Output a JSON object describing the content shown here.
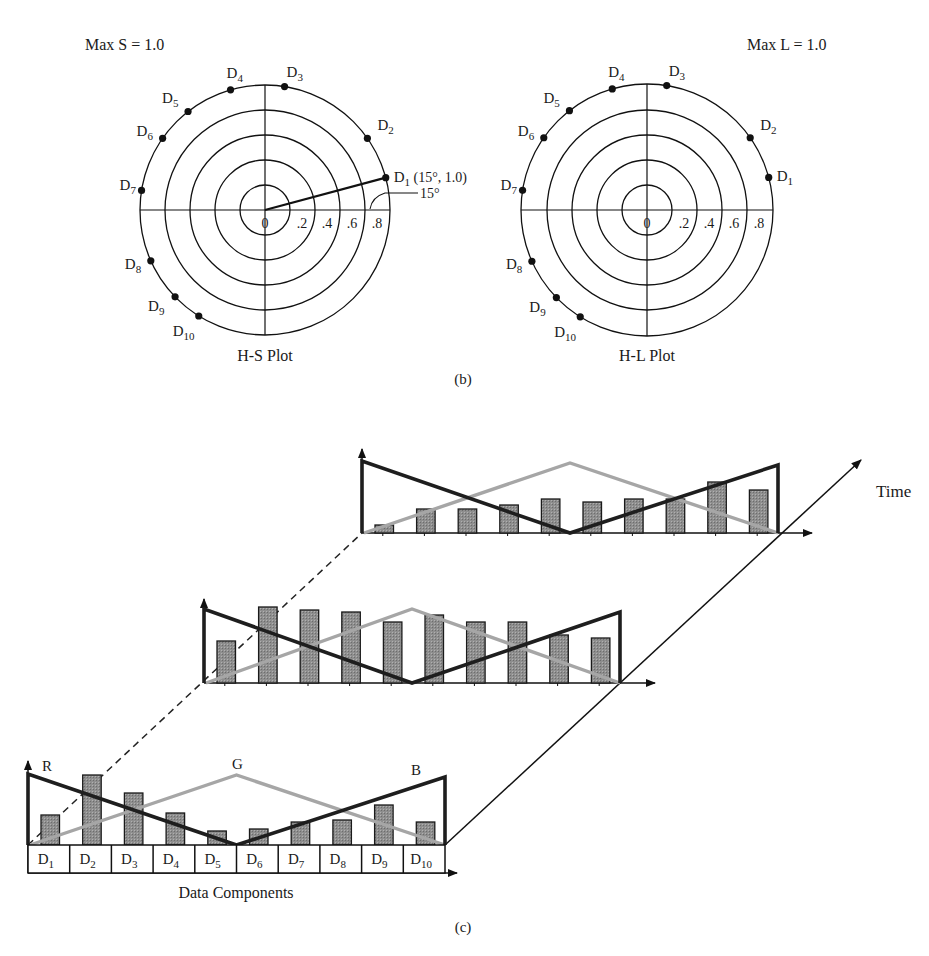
{
  "panel_b": {
    "caption": "(b)",
    "plots": [
      {
        "id": "hs",
        "title": "H-S Plot",
        "max_label": "Max S = 1.0",
        "center": [
          265,
          210
        ],
        "ring_radii": [
          25,
          50,
          75,
          100,
          125
        ],
        "tick_labels": [
          "0",
          ".2",
          ".4",
          ".6",
          ".8"
        ],
        "annotation": {
          "point_label": "(15°, 1.0)",
          "angle_label": "15°"
        },
        "points": [
          {
            "label": "D",
            "sub": "1",
            "angle": 15,
            "r": 1.0
          },
          {
            "label": "D",
            "sub": "2",
            "angle": 35,
            "r": 1.0
          },
          {
            "label": "D",
            "sub": "3",
            "angle": 81,
            "r": 1.0
          },
          {
            "label": "D",
            "sub": "4",
            "angle": 106,
            "r": 1.0
          },
          {
            "label": "D",
            "sub": "5",
            "angle": 128,
            "r": 1.0
          },
          {
            "label": "D",
            "sub": "6",
            "angle": 145,
            "r": 1.0
          },
          {
            "label": "D",
            "sub": "7",
            "angle": 171,
            "r": 1.0
          },
          {
            "label": "D",
            "sub": "8",
            "angle": 204,
            "r": 1.0
          },
          {
            "label": "D",
            "sub": "9",
            "angle": 224,
            "r": 1.0
          },
          {
            "label": "D",
            "sub": "10",
            "angle": 238,
            "r": 1.0
          }
        ]
      },
      {
        "id": "hl",
        "title": "H-L Plot",
        "max_label": "Max L = 1.0",
        "center": [
          647,
          210
        ],
        "ring_radii": [
          25,
          50,
          75,
          100,
          126
        ],
        "tick_labels": [
          "0",
          ".2",
          ".4",
          ".6",
          ".8"
        ],
        "points": [
          {
            "label": "D",
            "sub": "1",
            "angle": 15,
            "r": 1.0
          },
          {
            "label": "D",
            "sub": "2",
            "angle": 35,
            "r": 1.0
          },
          {
            "label": "D",
            "sub": "3",
            "angle": 81,
            "r": 1.0
          },
          {
            "label": "D",
            "sub": "4",
            "angle": 106,
            "r": 1.0
          },
          {
            "label": "D",
            "sub": "5",
            "angle": 128,
            "r": 1.0
          },
          {
            "label": "D",
            "sub": "6",
            "angle": 145,
            "r": 1.0
          },
          {
            "label": "D",
            "sub": "7",
            "angle": 171,
            "r": 1.0
          },
          {
            "label": "D",
            "sub": "8",
            "angle": 204,
            "r": 1.0
          },
          {
            "label": "D",
            "sub": "9",
            "angle": 224,
            "r": 1.0
          },
          {
            "label": "D",
            "sub": "10",
            "angle": 238,
            "r": 1.0
          }
        ]
      }
    ]
  },
  "panel_c": {
    "caption": "(c)",
    "time_label": "Time",
    "x_axis_label": "Data Components",
    "series_labels": {
      "r": "R",
      "g": "G",
      "b": "B"
    },
    "colors": {
      "bar_fill": "#8a8a8a",
      "bar_stroke": "#1a1a1a",
      "rb_line": "#1e1e1e",
      "g_line": "#a6a6a6",
      "axis": "#111111"
    },
    "components": [
      "D1",
      "D2",
      "D3",
      "D4",
      "D5",
      "D6",
      "D7",
      "D8",
      "D9",
      "D10"
    ],
    "slices": [
      {
        "name": "t0 (front)",
        "origin": [
          28,
          845
        ],
        "x_end": 457,
        "step": 41.7,
        "y_top": 765,
        "bar_heights": [
          30,
          70,
          52,
          32,
          14,
          16,
          23,
          25,
          40,
          23
        ],
        "r_start": 71,
        "g_peak": 70,
        "b_end": 68,
        "has_table": true
      },
      {
        "name": "t1 (middle)",
        "origin": [
          204,
          683
        ],
        "x_end": 655,
        "step": 41.6,
        "y_top": 603,
        "bar_heights": [
          42,
          76,
          73,
          71,
          61,
          68,
          61,
          61,
          48,
          45
        ],
        "r_start": 74,
        "g_peak": 74,
        "b_end": 71,
        "has_table": false
      },
      {
        "name": "t2 (back)",
        "origin": [
          362,
          533
        ],
        "x_end": 812,
        "step": 41.6,
        "y_top": 453,
        "bar_heights": [
          8,
          24,
          24,
          28,
          34,
          31,
          34,
          34,
          51,
          43
        ],
        "r_start": 72,
        "g_peak": 70,
        "b_end": 68,
        "has_table": false
      }
    ]
  },
  "chart_data": [
    {
      "type": "scatter",
      "title": "H-S Plot",
      "subtitle": "Max S = 1.0",
      "coordinate": "polar",
      "radial_ticks": [
        0,
        0.2,
        0.4,
        0.6,
        0.8
      ],
      "points": [
        {
          "name": "D1",
          "angle_deg": 15,
          "r": 1.0
        },
        {
          "name": "D2",
          "angle_deg": 35,
          "r": 1.0
        },
        {
          "name": "D3",
          "angle_deg": 81,
          "r": 1.0
        },
        {
          "name": "D4",
          "angle_deg": 106,
          "r": 1.0
        },
        {
          "name": "D5",
          "angle_deg": 128,
          "r": 1.0
        },
        {
          "name": "D6",
          "angle_deg": 145,
          "r": 1.0
        },
        {
          "name": "D7",
          "angle_deg": 171,
          "r": 1.0
        },
        {
          "name": "D8",
          "angle_deg": 204,
          "r": 1.0
        },
        {
          "name": "D9",
          "angle_deg": 224,
          "r": 1.0
        },
        {
          "name": "D10",
          "angle_deg": 238,
          "r": 1.0
        }
      ],
      "annotations": [
        "D1 (15°, 1.0)",
        "15°"
      ]
    },
    {
      "type": "scatter",
      "title": "H-L Plot",
      "subtitle": "Max L = 1.0",
      "coordinate": "polar",
      "radial_ticks": [
        0,
        0.2,
        0.4,
        0.6,
        0.8
      ],
      "points": [
        {
          "name": "D1",
          "angle_deg": 15,
          "r": 1.0
        },
        {
          "name": "D2",
          "angle_deg": 35,
          "r": 1.0
        },
        {
          "name": "D3",
          "angle_deg": 81,
          "r": 1.0
        },
        {
          "name": "D4",
          "angle_deg": 106,
          "r": 1.0
        },
        {
          "name": "D5",
          "angle_deg": 128,
          "r": 1.0
        },
        {
          "name": "D6",
          "angle_deg": 145,
          "r": 1.0
        },
        {
          "name": "D7",
          "angle_deg": 171,
          "r": 1.0
        },
        {
          "name": "D8",
          "angle_deg": 204,
          "r": 1.0
        },
        {
          "name": "D9",
          "angle_deg": 224,
          "r": 1.0
        },
        {
          "name": "D10",
          "angle_deg": 238,
          "r": 1.0
        }
      ]
    },
    {
      "type": "bar",
      "title": "(c) Data components over time with R/G/B envelopes",
      "xlabel": "Data Components",
      "zlabel": "Time",
      "categories": [
        "D1",
        "D2",
        "D3",
        "D4",
        "D5",
        "D6",
        "D7",
        "D8",
        "D9",
        "D10"
      ],
      "series": [
        {
          "name": "t0",
          "values": [
            0.38,
            0.88,
            0.65,
            0.4,
            0.18,
            0.2,
            0.29,
            0.31,
            0.5,
            0.29
          ]
        },
        {
          "name": "t1",
          "values": [
            0.53,
            0.95,
            0.91,
            0.89,
            0.76,
            0.85,
            0.76,
            0.76,
            0.6,
            0.56
          ]
        },
        {
          "name": "t2",
          "values": [
            0.1,
            0.3,
            0.3,
            0.35,
            0.43,
            0.39,
            0.43,
            0.43,
            0.64,
            0.54
          ]
        }
      ],
      "envelopes": {
        "R": "linear from max at D1 to 0 at D5",
        "G": "triangle peaking at D5/D6 boundary",
        "B": "linear from 0 at D5 to max at D10"
      },
      "grid": false
    }
  ]
}
